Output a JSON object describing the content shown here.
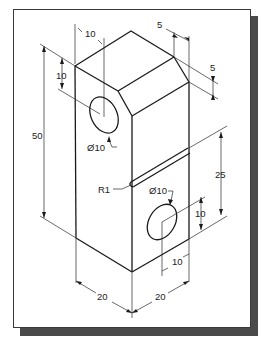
{
  "figure": {
    "type": "isometric engineering drawing",
    "frame_color": "#3a3a3a",
    "shadow_color": "#4a4a4a",
    "line_color": "#1a1a1a"
  },
  "dimensions": {
    "top_offset_left": "10",
    "top_height_left": "10",
    "overall_height": "50",
    "chamfer_horizontal": "5",
    "chamfer_vertical": "5",
    "upper_hole_dia": "Ø10",
    "groove_radius": "R1",
    "lower_hole_dia": "Ø10",
    "groove_height": "25",
    "lower_hole_height": "10",
    "lower_hole_offset": "10",
    "width_left": "20",
    "width_right": "20"
  }
}
